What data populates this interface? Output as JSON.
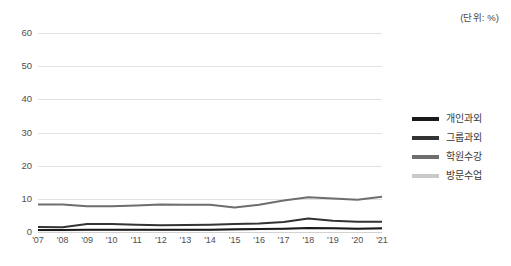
{
  "unit_note": "(단위: %)",
  "legend": {
    "position": "right",
    "items": [
      {
        "label": "개인과외",
        "color": "#1a1a1a"
      },
      {
        "label": "그룹과외",
        "color": "#333333"
      },
      {
        "label": "학원수강",
        "color": "#6e6e6e"
      },
      {
        "label": "방문수업",
        "color": "#c9c9c9"
      }
    ]
  },
  "chart_data": {
    "type": "line",
    "title": "",
    "subtitle": "",
    "xlabel": "",
    "ylabel": "",
    "unit": "%",
    "grid": true,
    "legend_position": "right",
    "categories": [
      "'07",
      "'08",
      "'09",
      "'10",
      "'11",
      "'12",
      "'13",
      "'14",
      "'15",
      "'16",
      "'17",
      "'18",
      "'19",
      "'20",
      "'21"
    ],
    "x": [
      2007,
      2008,
      2009,
      2010,
      2011,
      2012,
      2013,
      2014,
      2015,
      2016,
      2017,
      2018,
      2019,
      2020,
      2021
    ],
    "ylim": [
      0,
      60
    ],
    "yticks": [
      0,
      10,
      20,
      30,
      40,
      50,
      60
    ],
    "ytick_labels": [
      "0",
      "10",
      "20",
      "30",
      "40",
      "50",
      "60"
    ],
    "series": [
      {
        "name": "개인과외",
        "color": "#1a1a1a",
        "values": [
          0.6,
          0.6,
          0.7,
          0.7,
          0.7,
          0.7,
          0.7,
          0.7,
          0.8,
          0.9,
          1.0,
          1.2,
          1.1,
          1.0,
          1.1
        ]
      },
      {
        "name": "그룹과외",
        "color": "#333333",
        "values": [
          1.5,
          1.4,
          2.4,
          2.4,
          2.2,
          2.0,
          2.1,
          2.2,
          2.4,
          2.6,
          3.0,
          4.1,
          3.4,
          3.1,
          3.1
        ]
      },
      {
        "name": "학원수강",
        "color": "#6e6e6e",
        "values": [
          8.3,
          8.3,
          7.8,
          7.8,
          8.0,
          8.3,
          8.2,
          8.2,
          7.4,
          8.2,
          9.5,
          10.5,
          10.1,
          9.7,
          10.6
        ]
      },
      {
        "name": "방문수업",
        "color": "#c9c9c9",
        "values": [
          0.5,
          0.5,
          0.6,
          0.6,
          0.6,
          0.6,
          0.6,
          0.6,
          0.7,
          0.8,
          0.9,
          1.2,
          1.1,
          1.0,
          1.0
        ]
      }
    ]
  }
}
